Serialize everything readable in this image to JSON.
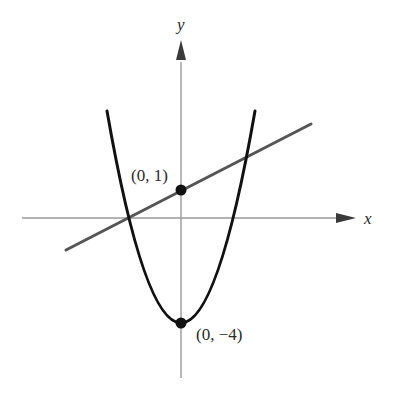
{
  "figure": {
    "x_axis_label": "x",
    "y_axis_label": "y",
    "points": [
      {
        "label": "(0, 1)",
        "x": 0,
        "y": 1
      },
      {
        "label": "(0, −4)",
        "x": 0,
        "y": -4
      }
    ],
    "curves": [
      {
        "name": "parabola",
        "equation": "y = x^2 - 4",
        "color": "#111111"
      },
      {
        "name": "line",
        "equation": "y = x/2 + 1",
        "color": "#555555"
      }
    ],
    "intersections": [
      {
        "x": -2,
        "y": 0
      },
      {
        "x": 2.5,
        "y": 2.25
      }
    ],
    "colors": {
      "axis": "#9a9a9a",
      "parabola": "#111111",
      "line": "#555555",
      "point": "#111111"
    }
  }
}
